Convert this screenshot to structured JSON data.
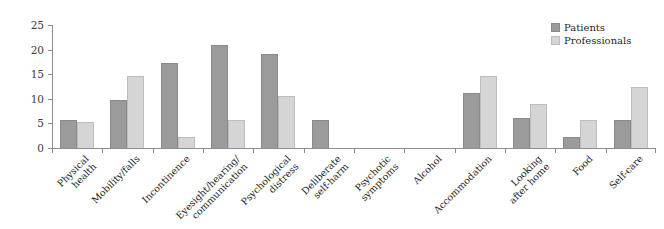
{
  "chart_data": {
    "type": "bar",
    "title": "",
    "xlabel": "",
    "ylabel": "",
    "ylim": [
      0,
      25
    ],
    "yticks": [
      0,
      5,
      10,
      15,
      20,
      25
    ],
    "grid": false,
    "legend_position": "top-right",
    "categories": [
      "Physical\nhealth",
      "Mobility/falls",
      "Incontinence",
      "Eyesight/hearing/\ncommunication",
      "Psychological\ndistress",
      "Deliberate\nself-harm",
      "Psychotic\nsymptoms",
      "Alcohol",
      "Accommodation",
      "Looking\nafter home",
      "Food",
      "Self-care"
    ],
    "series": [
      {
        "name": "Patients",
        "color": "#9b9b9b",
        "values": [
          5.7,
          9.8,
          17.2,
          21.0,
          19.2,
          5.7,
          0,
          0,
          11.2,
          6.1,
          2.3,
          5.7
        ]
      },
      {
        "name": "Professionals",
        "color": "#d5d5d5",
        "values": [
          5.3,
          14.6,
          2.3,
          5.7,
          10.6,
          0,
          0,
          0,
          14.6,
          9.0,
          5.7,
          12.5
        ]
      }
    ]
  },
  "legend": {
    "items": [
      {
        "label": "Patients",
        "swatch": "patients-swatch"
      },
      {
        "label": "Professionals",
        "swatch": "professionals-swatch"
      }
    ]
  },
  "axis": {
    "y_tick_labels": [
      "0",
      "5",
      "10",
      "15",
      "20",
      "25"
    ]
  }
}
